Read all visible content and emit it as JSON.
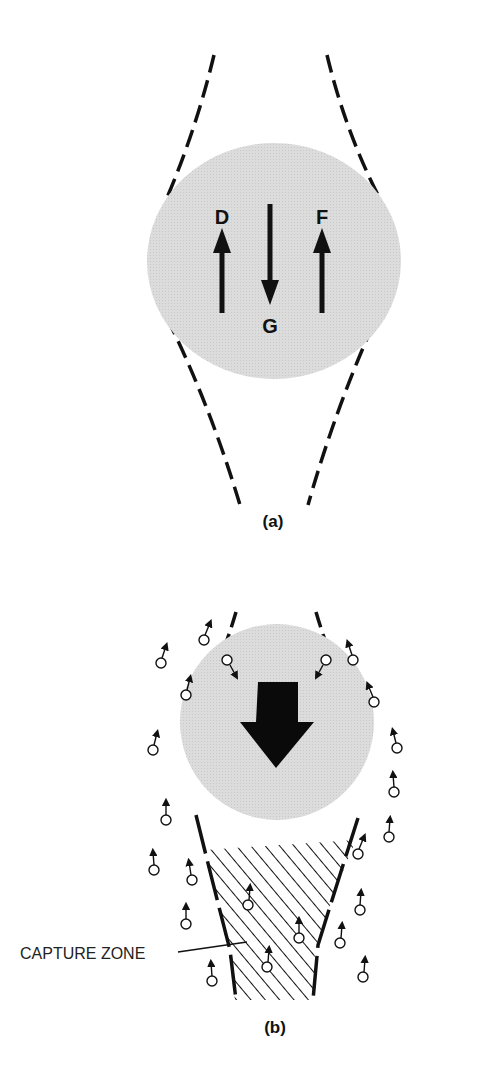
{
  "panel_a": {
    "label": "(a)",
    "forces": [
      {
        "symbol": "D",
        "direction": "up"
      },
      {
        "symbol": "G",
        "direction": "down"
      },
      {
        "symbol": "F",
        "direction": "up"
      }
    ]
  },
  "panel_b": {
    "label": "(b)",
    "annotation": "CAPTURE ZONE"
  },
  "colors": {
    "sphere_fill": "#d9d9d9",
    "ink": "#111111"
  }
}
